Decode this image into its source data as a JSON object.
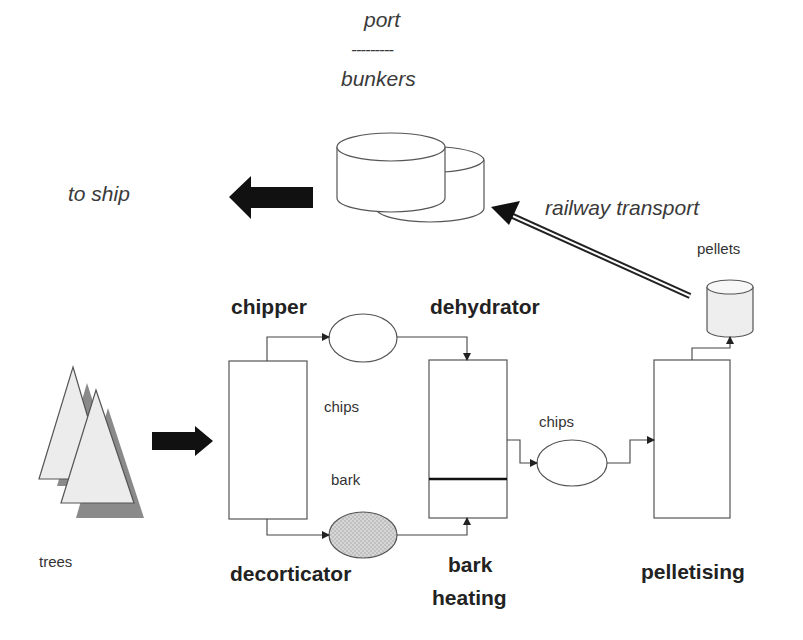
{
  "diagram": {
    "type": "process-flow",
    "labels": {
      "port": "port",
      "separator": "---------",
      "bunkers": "bunkers",
      "to_ship": "to ship",
      "railway_transport": "railway transport",
      "pellets": "pellets",
      "chipper": "chipper",
      "dehydrator": "dehydrator",
      "chips_1": "chips",
      "bark": "bark",
      "chips_2": "chips",
      "trees": "trees",
      "decorticator": "decorticator",
      "bark_heating_1": "bark",
      "bark_heating_2": "heating",
      "pelletising": "pelletising"
    },
    "nodes": [
      {
        "id": "trees",
        "label": "trees",
        "shape": "triangles"
      },
      {
        "id": "chipper_decorticator",
        "label": "chipper / decorticator",
        "shape": "rectangle"
      },
      {
        "id": "chips_buffer",
        "label": "chips",
        "shape": "ellipse"
      },
      {
        "id": "bark_buffer",
        "label": "bark",
        "shape": "ellipse-hatched"
      },
      {
        "id": "dehydrator",
        "label": "dehydrator / bark heating",
        "shape": "rectangle-split"
      },
      {
        "id": "chips_buffer_2",
        "label": "chips",
        "shape": "ellipse"
      },
      {
        "id": "pelletising",
        "label": "pelletising",
        "shape": "rectangle"
      },
      {
        "id": "pellets",
        "label": "pellets",
        "shape": "cylinder"
      },
      {
        "id": "port_bunkers",
        "label": "port bunkers",
        "shape": "double-cylinder"
      },
      {
        "id": "ship",
        "label": "to ship",
        "shape": "text"
      }
    ],
    "edges": [
      {
        "from": "trees",
        "to": "chipper_decorticator"
      },
      {
        "from": "chipper_decorticator",
        "to": "chips_buffer"
      },
      {
        "from": "chips_buffer",
        "to": "dehydrator"
      },
      {
        "from": "chipper_decorticator",
        "to": "bark_buffer"
      },
      {
        "from": "bark_buffer",
        "to": "dehydrator"
      },
      {
        "from": "dehydrator",
        "to": "chips_buffer_2"
      },
      {
        "from": "chips_buffer_2",
        "to": "pelletising"
      },
      {
        "from": "pelletising",
        "to": "pellets"
      },
      {
        "from": "pellets",
        "to": "port_bunkers",
        "label": "railway transport"
      },
      {
        "from": "port_bunkers",
        "to": "ship"
      }
    ],
    "colors": {
      "stroke": "#444444",
      "arrow_fill": "#111111",
      "tree_fill": "#ececec",
      "tree_shadow": "#8a8a8a",
      "bark_fill": "#cfcfcf",
      "pellet_fill": "#eeeeee"
    }
  }
}
